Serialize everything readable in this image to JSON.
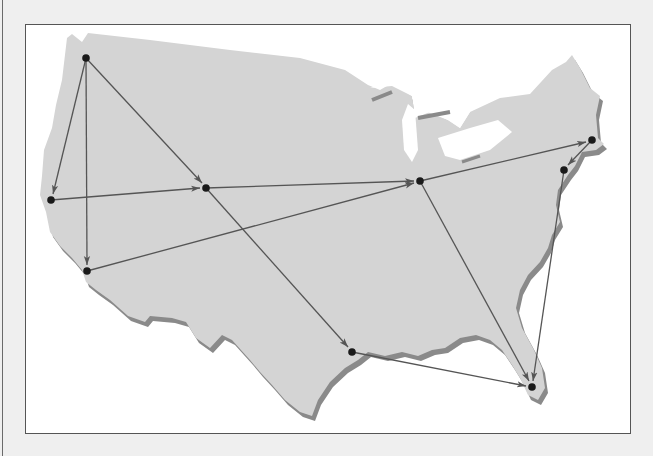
{
  "figure": {
    "type": "directed-network-on-map",
    "region": "Contiguous United States",
    "colors": {
      "background": "#efefef",
      "frame_border": "#555555",
      "frame_fill": "#ffffff",
      "land": "#d4d4d4",
      "land_shadow": "#8a8a8a",
      "edge": "#555555",
      "node": "#1a1a1a"
    },
    "nodes": [
      {
        "id": "n1",
        "approx_location": "Seattle",
        "x": 86,
        "y": 58
      },
      {
        "id": "n2",
        "approx_location": "San Francisco",
        "x": 51,
        "y": 200
      },
      {
        "id": "n3",
        "approx_location": "Los Angeles",
        "x": 87,
        "y": 271
      },
      {
        "id": "n4",
        "approx_location": "Denver",
        "x": 206,
        "y": 188
      },
      {
        "id": "n5",
        "approx_location": "Chicago",
        "x": 420,
        "y": 181
      },
      {
        "id": "n6",
        "approx_location": "Boston",
        "x": 592,
        "y": 140
      },
      {
        "id": "n7",
        "approx_location": "New York",
        "x": 564,
        "y": 170
      },
      {
        "id": "n8",
        "approx_location": "Houston",
        "x": 352,
        "y": 352
      },
      {
        "id": "n9",
        "approx_location": "Miami",
        "x": 532,
        "y": 387
      }
    ],
    "edges": [
      {
        "from": "n1",
        "to": "n2"
      },
      {
        "from": "n1",
        "to": "n3"
      },
      {
        "from": "n1",
        "to": "n4"
      },
      {
        "from": "n2",
        "to": "n4"
      },
      {
        "from": "n4",
        "to": "n5"
      },
      {
        "from": "n4",
        "to": "n8"
      },
      {
        "from": "n3",
        "to": "n5"
      },
      {
        "from": "n5",
        "to": "n6"
      },
      {
        "from": "n5",
        "to": "n9"
      },
      {
        "from": "n6",
        "to": "n7"
      },
      {
        "from": "n7",
        "to": "n9"
      },
      {
        "from": "n8",
        "to": "n9"
      }
    ]
  }
}
